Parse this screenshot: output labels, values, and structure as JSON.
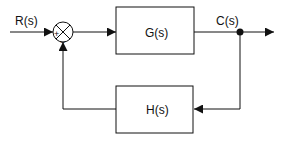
{
  "diagram": {
    "type": "feedback-control-block-diagram",
    "input_label": "R(s)",
    "output_label": "C(s)",
    "forward_block": "G(s)",
    "feedback_block": "H(s)",
    "summing_junction": {
      "plus_sign": "+",
      "minus_sign": "−"
    },
    "colors": {
      "line": "#111111",
      "background": "#ffffff"
    }
  }
}
